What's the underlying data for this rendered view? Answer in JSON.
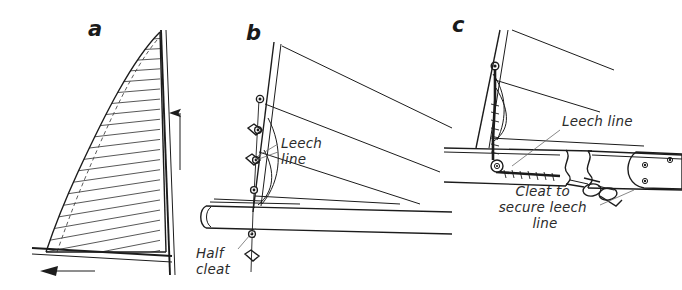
{
  "figure": {
    "background_color": "#ffffff",
    "ink_color": "#1c1c1c",
    "width": 682,
    "height": 290
  },
  "panels": [
    {
      "id": "a",
      "label": "a",
      "label_x": 88,
      "label_y": 36,
      "description": "Sail plan with hatched sail area, curved leech, mast and boom with direction arrows"
    },
    {
      "id": "b",
      "label": "b",
      "label_x": 246,
      "label_y": 40,
      "description": "Leech edge detail showing leech line running down through eyelets to a half cleat at the boom"
    },
    {
      "id": "c",
      "label": "c",
      "label_x": 452,
      "label_y": 32,
      "description": "Boom end detail showing leech line over a sheave and secured at a cleat"
    }
  ],
  "callouts": [
    {
      "id": "leech-line-b",
      "panel": "b",
      "lines": [
        "Leech",
        "line"
      ],
      "x": 281,
      "y": 148,
      "line_height": 16,
      "anchor": "start",
      "leader": "M 278 144 L 258 156"
    },
    {
      "id": "half-cleat-b",
      "panel": "b",
      "lines": [
        "Half",
        "cleat"
      ],
      "x": 196,
      "y": 258,
      "line_height": 16,
      "anchor": "start",
      "leader": "M 238 249 L 256 228"
    },
    {
      "id": "leech-line-c",
      "panel": "c",
      "lines": [
        "Leech line"
      ],
      "x": 562,
      "y": 126,
      "line_height": 16,
      "anchor": "start",
      "leader": "M 560 130 L 512 166"
    },
    {
      "id": "cleat-secure-c",
      "panel": "c",
      "lines": [
        "Cleat to",
        "secure leech",
        "line"
      ],
      "x": 545,
      "y": 196,
      "line_height": 16,
      "anchor": "middle",
      "leader": "M 600 205 L 632 190"
    }
  ],
  "arrows": [
    {
      "id": "luff-up-arrow",
      "panel": "a",
      "direction": "up",
      "meaning": "halyard tension upward"
    },
    {
      "id": "foot-left-arrow",
      "panel": "a",
      "direction": "left",
      "meaning": "outhaul tension along boom"
    }
  ],
  "hardware": [
    {
      "id": "eyelet",
      "panel": "b",
      "count": 5,
      "name": "leech line eyelet"
    },
    {
      "id": "half-cleat",
      "panel": "b",
      "count": 1,
      "name": "half cleat"
    },
    {
      "id": "sheave",
      "panel": "c",
      "count": 1,
      "name": "sheave"
    },
    {
      "id": "cleat",
      "panel": "c",
      "count": 1,
      "name": "cleat"
    },
    {
      "id": "rivet",
      "panel": "c",
      "count": 3,
      "name": "boom end rivet"
    }
  ]
}
